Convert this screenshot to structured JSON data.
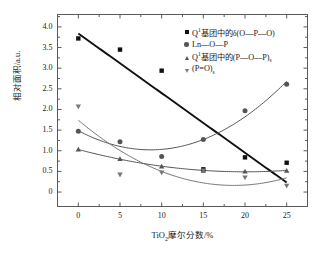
{
  "chart_data": {
    "type": "scatter",
    "title": "",
    "xlabel": "TiO2摩尔分数/%",
    "ylabel": "相对面积/a.u.",
    "x": [
      0,
      5,
      10,
      15,
      20,
      25
    ],
    "xlim": [
      -2.5,
      27.5
    ],
    "ylim": [
      -0.35,
      4.3
    ],
    "xticks": [
      "0",
      "5",
      "10",
      "15",
      "20",
      "25"
    ],
    "yticks": [
      "0",
      "0.5",
      "1.0",
      "1.5",
      "2.0",
      "2.5",
      "3.0",
      "3.5",
      "4.0"
    ],
    "grid": false,
    "legend_position": "top-right",
    "series": [
      {
        "name": "Q1基团中的δ(O—P—O)",
        "marker": "square",
        "color": "#111111",
        "fit": "linear",
        "values": [
          3.72,
          3.45,
          2.94,
          0.55,
          0.84,
          0.71
        ]
      },
      {
        "name": "Ln—O—P",
        "marker": "circle",
        "color": "#555555",
        "fit": "quadratic",
        "values": [
          1.47,
          1.22,
          0.86,
          1.27,
          1.97,
          2.61
        ]
      },
      {
        "name": "Q1基团中的(P—O—P)s",
        "marker": "triangle-up",
        "color": "#555555",
        "fit": "quadratic",
        "values": [
          1.03,
          0.8,
          0.62,
          0.52,
          0.5,
          0.52
        ]
      },
      {
        "name": "(P=O)s",
        "marker": "triangle-down",
        "color": "#777777",
        "fit": "quadratic",
        "values": [
          2.07,
          0.42,
          0.47,
          0.52,
          0.35,
          0.15
        ]
      }
    ]
  },
  "axes": {
    "y_title": "相对面积/a.u.",
    "x_title_main": "TiO",
    "x_title_sub": "2",
    "x_title_rest": "摩尔分数/%",
    "yticks": [
      "4.0",
      "3.5",
      "3.0",
      "2.5",
      "2.0",
      "1.5",
      "1.0",
      "0.5",
      "0"
    ],
    "xticks": [
      "0",
      "5",
      "10",
      "15",
      "20",
      "25"
    ]
  },
  "legend": {
    "items": [
      {
        "marker": "square",
        "prefix": "Q",
        "sup": "1",
        "body": "基团中的δ(O—P—O)",
        "sub": ""
      },
      {
        "marker": "circle",
        "prefix": "Ln—O—P",
        "sup": "",
        "body": "",
        "sub": ""
      },
      {
        "marker": "triangle-up",
        "prefix": "Q",
        "sup": "1",
        "body": "基团中的(P—O—P)",
        "sub": "s"
      },
      {
        "marker": "triangle-down",
        "prefix": "(P",
        "sup": "",
        "body": "=O)",
        "sub": "s"
      }
    ]
  }
}
